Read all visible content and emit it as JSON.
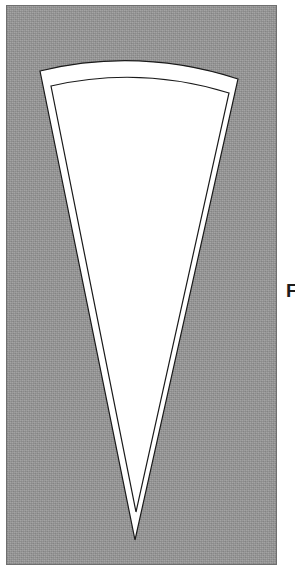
{
  "figure": {
    "kind": "geometric-line-drawing",
    "panel": {
      "fill_color": "#979797",
      "border_color": "#6f6f6f",
      "x": 6,
      "y": 5,
      "width": 271,
      "height": 560
    },
    "shape": {
      "name": "wedge",
      "fill_color": "#ffffff",
      "stroke_color": "#1a1a1a",
      "stroke_width": 1.2,
      "outer": {
        "apex_x": 135,
        "apex_y": 540,
        "top_left_x": 40,
        "top_left_y": 71,
        "top_right_x": 238,
        "top_right_y": 79,
        "arc_sagitta": 14
      },
      "inner": {
        "apex_x": 136,
        "apex_y": 512,
        "top_left_x": 51,
        "top_left_y": 86,
        "top_right_x": 229,
        "top_right_y": 93,
        "arc_sagitta": 12
      },
      "gap_color": "#ffffff"
    }
  },
  "edge_label": {
    "text": "F",
    "color": "#1c1c1c",
    "clipped": true
  }
}
